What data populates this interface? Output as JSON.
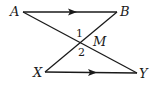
{
  "diagram": {
    "points": {
      "A": {
        "label": "A",
        "x": 23,
        "y": 12
      },
      "B": {
        "label": "B",
        "x": 117,
        "y": 12
      },
      "X": {
        "label": "X",
        "x": 45,
        "y": 72
      },
      "Y": {
        "label": "Y",
        "x": 137,
        "y": 73
      },
      "M": {
        "label": "M",
        "x": 80,
        "y": 42
      }
    },
    "segments": [
      {
        "from": "A",
        "to": "B",
        "arrow": true
      },
      {
        "from": "X",
        "to": "Y",
        "arrow": true
      },
      {
        "from": "A",
        "to": "Y",
        "arrow": false
      },
      {
        "from": "B",
        "to": "X",
        "arrow": false
      }
    ],
    "angles": {
      "angle1": "1",
      "angle2": "2"
    },
    "colors": {
      "stroke": "#1a1a1a",
      "background": "#ffffff"
    }
  }
}
